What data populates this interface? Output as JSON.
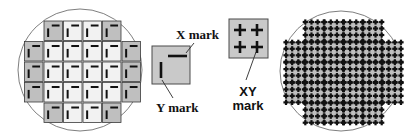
{
  "figure": {
    "kind": "semiconductor-wafer-alignment-mark-diagram",
    "width": 410,
    "height": 140,
    "background_color": "#ffffff"
  },
  "colors": {
    "wafer_outline": "#6f6f6f",
    "die_fill_light": "#f2f2f2",
    "die_fill_dark": "#bfbfbf",
    "die_stroke": "#3a3a3a",
    "mark_color": "#111111",
    "legend_box_fill": "#c9c9c9",
    "legend_box_stroke": "#4a4a4a",
    "leader_line": "#2a2a2a",
    "text_color": "#111111"
  },
  "labels": {
    "x_mark": "X mark",
    "y_mark": "Y mark",
    "xy_mark_line1": "XY",
    "xy_mark_line2": "mark"
  },
  "left_wafer": {
    "name": "wafer-xy-separate-marks",
    "center": {
      "cx": 80,
      "cy": 70
    },
    "radius": {
      "rx": 62,
      "ry": 61
    },
    "die": {
      "width": 18.5,
      "height": 19.5,
      "gap": 1.0
    },
    "grid_origin": {
      "x": 24.5,
      "y": 21.0
    },
    "rows": [
      {
        "start_col": 1,
        "count": 4,
        "shaded_cols": [
          1,
          4
        ]
      },
      {
        "start_col": 0,
        "count": 6,
        "shaded_cols": [
          0,
          5
        ]
      },
      {
        "start_col": 0,
        "count": 6,
        "shaded_cols": [
          0,
          5
        ]
      },
      {
        "start_col": 0,
        "count": 6,
        "shaded_cols": [
          0,
          5
        ]
      },
      {
        "start_col": 1,
        "count": 4,
        "shaded_cols": [
          1,
          4
        ]
      }
    ],
    "die_marks": {
      "x_mark": {
        "type": "horizontal-bar",
        "offset_x": 0.42,
        "offset_y": 0.18,
        "length": 0.42,
        "thickness": 2.0
      },
      "y_mark": {
        "type": "vertical-bar",
        "offset_x": 0.17,
        "offset_y": 0.38,
        "length": 0.44,
        "thickness": 2.0
      }
    }
  },
  "right_wafer": {
    "name": "wafer-combined-xy-marks",
    "center": {
      "cx": 341,
      "cy": 71
    },
    "radius": {
      "rx": 61,
      "ry": 60
    },
    "die": {
      "width": 18.5,
      "height": 19.5,
      "gap": 0.8
    },
    "grid_origin": {
      "x": 286.0,
      "y": 22.0
    },
    "rows": [
      {
        "start_col": 1,
        "count": 4
      },
      {
        "start_col": 0,
        "count": 6
      },
      {
        "start_col": 0,
        "count": 6
      },
      {
        "start_col": 0,
        "count": 6
      },
      {
        "start_col": 1,
        "count": 4
      }
    ],
    "die_marks": {
      "xy_mark": {
        "type": "cross",
        "per_die": 4,
        "arm_length": 5.2,
        "thickness": 2.2
      }
    }
  },
  "legend_x_y": {
    "name": "legend-x-y-mark",
    "box": {
      "x": 152,
      "y": 46,
      "width": 38,
      "height": 38
    },
    "x_mark": {
      "type": "horizontal-bar",
      "x1": 168,
      "y1": 56,
      "x2": 187,
      "y2": 56,
      "thickness": 2.6
    },
    "y_mark": {
      "type": "vertical-bar",
      "x1": 161,
      "y1": 62,
      "x2": 161,
      "y2": 78,
      "thickness": 2.6
    },
    "leader_x": {
      "x1": 186,
      "y1": 53,
      "x2": 194,
      "y2": 43
    },
    "leader_y": {
      "x1": 162,
      "y1": 80,
      "x2": 173,
      "y2": 98
    }
  },
  "legend_xy": {
    "name": "legend-xy-mark",
    "box": {
      "x": 229,
      "y": 19,
      "width": 39,
      "height": 39
    },
    "crosses": [
      {
        "cx": 240,
        "cy": 30
      },
      {
        "cx": 257,
        "cy": 30
      },
      {
        "cx": 240,
        "cy": 47
      },
      {
        "cx": 257,
        "cy": 47
      }
    ],
    "cross_arm": 6.0,
    "cross_thickness": 2.6,
    "leader": {
      "x1": 256,
      "y1": 52,
      "x2": 246,
      "y2": 80
    }
  }
}
